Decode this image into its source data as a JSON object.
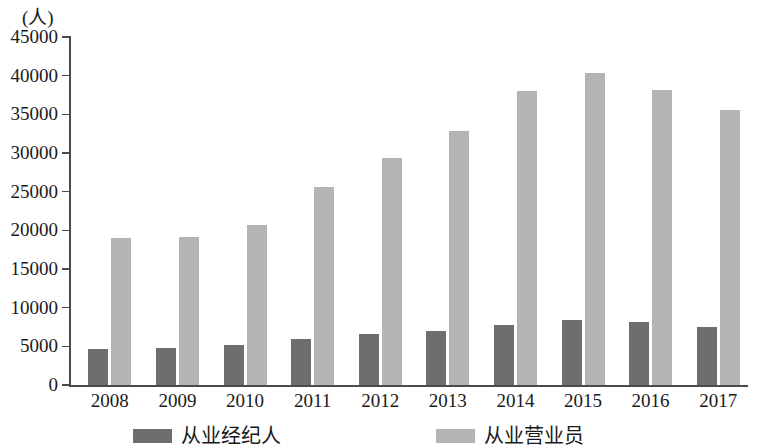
{
  "chart_data": {
    "type": "bar",
    "title": "",
    "subtitle": "",
    "xlabel": "",
    "ylabel": "(人)",
    "unit_label": "(人)",
    "categories": [
      "2008",
      "2009",
      "2010",
      "2011",
      "2012",
      "2013",
      "2014",
      "2015",
      "2016",
      "2017"
    ],
    "series": [
      {
        "name": "从业经纪人",
        "color": "#6e6e6e",
        "values": [
          4600,
          4800,
          5200,
          5900,
          6600,
          7000,
          7800,
          8400,
          8200,
          7500
        ]
      },
      {
        "name": "从业营业员",
        "color": "#b4b4b4",
        "values": [
          19000,
          19100,
          20700,
          25600,
          29300,
          32900,
          38000,
          40400,
          38100,
          35600
        ]
      }
    ],
    "ylim": [
      0,
      45000
    ],
    "ytick_values": [
      0,
      5000,
      10000,
      15000,
      20000,
      25000,
      30000,
      35000,
      40000,
      45000
    ],
    "ytick_labels": [
      "0",
      "5000",
      "10000",
      "15000",
      "20000",
      "25000",
      "30000",
      "35000",
      "40000",
      "45000"
    ],
    "grid": false,
    "legend_position": "bottom"
  },
  "legend": {
    "items": [
      {
        "label": "从业经纪人",
        "swatch": "dark-swatch"
      },
      {
        "label": "从业营业员",
        "swatch": "light-swatch"
      }
    ]
  }
}
